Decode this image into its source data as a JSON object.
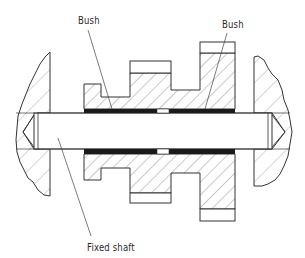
{
  "diagram": {
    "labels": {
      "bush_left": "Bush",
      "bush_right": "Bush",
      "fixed_shaft": "Fixed shaft"
    },
    "colors": {
      "line": "#333333",
      "hatch": "#666666",
      "bush_fill": "#1a1a1a",
      "background": "#ffffff"
    },
    "components": [
      "frame-left",
      "frame-right",
      "fixed-shaft",
      "gear-cluster",
      "bush-left",
      "bush-right"
    ]
  }
}
